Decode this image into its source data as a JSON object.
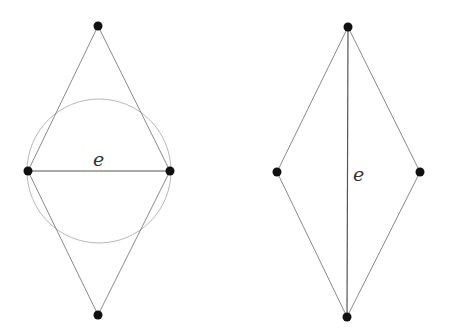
{
  "diagrams": [
    {
      "id": "left",
      "description": "Rhombus with horizontal diagonal edge e and circle with e as diameter",
      "vertices": [
        {
          "name": "top",
          "x": 98,
          "y": 26
        },
        {
          "name": "left",
          "x": 28,
          "y": 171
        },
        {
          "name": "right",
          "x": 170,
          "y": 171
        },
        {
          "name": "bottom",
          "x": 98,
          "y": 315
        }
      ],
      "edges": [
        {
          "from": "top",
          "to": "left"
        },
        {
          "from": "top",
          "to": "right"
        },
        {
          "from": "bottom",
          "to": "left"
        },
        {
          "from": "bottom",
          "to": "right"
        }
      ],
      "labeled_edge": {
        "from": "left",
        "to": "right",
        "label": "e"
      },
      "circle": {
        "cx": 99,
        "cy": 171,
        "r": 72
      },
      "label": {
        "text": "e",
        "x": 93,
        "y": 166
      }
    },
    {
      "id": "right",
      "description": "Rhombus with vertical diagonal edge e",
      "vertices": [
        {
          "name": "top",
          "x": 348,
          "y": 27
        },
        {
          "name": "left",
          "x": 277,
          "y": 172
        },
        {
          "name": "right",
          "x": 420,
          "y": 172
        },
        {
          "name": "bottom",
          "x": 347,
          "y": 317
        }
      ],
      "edges": [
        {
          "from": "top",
          "to": "left"
        },
        {
          "from": "top",
          "to": "right"
        },
        {
          "from": "bottom",
          "to": "left"
        },
        {
          "from": "bottom",
          "to": "right"
        }
      ],
      "labeled_edge": {
        "from": "top",
        "to": "bottom",
        "label": "e"
      },
      "label": {
        "text": "e",
        "x": 353,
        "y": 181
      }
    }
  ],
  "colors": {
    "background": "#ffffff",
    "edge": "#8a8a8a",
    "labeled_edge": "#555555",
    "circle": "#b8b8b8",
    "vertex": "#111111",
    "label": "#333333"
  }
}
